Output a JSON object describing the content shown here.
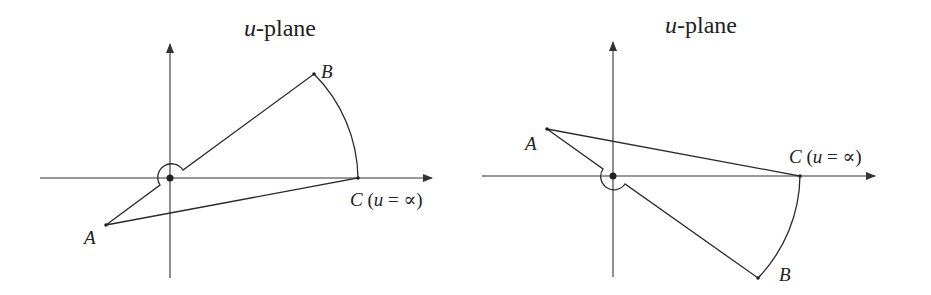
{
  "figure": {
    "panels": [
      {
        "id": "left",
        "title_var": "u",
        "title_rest": "-plane",
        "points": {
          "A": {
            "label": "A"
          },
          "B": {
            "label": "B"
          },
          "C": {
            "label_var": "C",
            "label_open": " (",
            "label_u": "u",
            "label_eq": " = ∝)"
          }
        }
      },
      {
        "id": "right",
        "title_var": "u",
        "title_rest": "-plane",
        "points": {
          "A": {
            "label": "A"
          },
          "B": {
            "label": "B"
          },
          "C": {
            "label_var": "C",
            "label_open": " (",
            "label_u": "u",
            "label_eq": " = ∝)"
          }
        }
      }
    ],
    "colors": {
      "ink": "#2a2a2a",
      "background": "#ffffff"
    }
  }
}
